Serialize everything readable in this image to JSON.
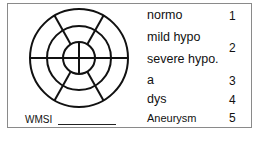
{
  "diagram": {
    "type": "bullseye-segment-chart",
    "rings": 3,
    "outer_segments": 6,
    "inner_segments": 4,
    "stroke_color": "#111111"
  },
  "wmsi": {
    "label": "WMSI",
    "value": ""
  },
  "legend": {
    "items": [
      {
        "label": "normo",
        "score": "1"
      },
      {
        "label": "mild hypo",
        "score": "2"
      },
      {
        "label": "severe hypo.",
        "score": ""
      },
      {
        "label": "a",
        "score": "3"
      },
      {
        "label": "dys",
        "score": "4"
      },
      {
        "label": "Aneurysm",
        "score": "5"
      }
    ]
  }
}
